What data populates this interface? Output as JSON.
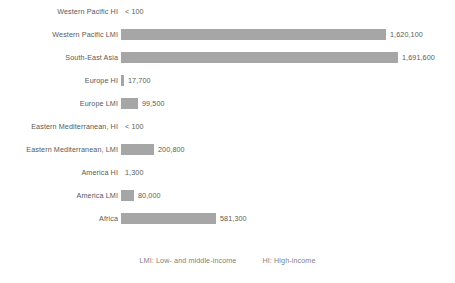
{
  "chart_data": {
    "type": "bar",
    "orientation": "horizontal",
    "title": "",
    "xlabel": "",
    "ylabel": "",
    "grid": false,
    "axis_visible": false,
    "xlim": [
      0,
      1691600
    ],
    "bar_color": "#a6a6a6",
    "label_color": "#595959",
    "categories": [
      "Western Pacific HI",
      "Western Pacific LMI",
      "South-East Asia",
      "Europe HI",
      "Europe LMI",
      "Eastern Mediterranean, HI",
      "Eastern Mediterranean, LMI",
      "America HI",
      "America LMI",
      "Africa"
    ],
    "values": [
      0,
      1620100,
      1691600,
      17700,
      99500,
      0,
      200800,
      1300,
      80000,
      581300
    ],
    "value_labels": [
      "< 100",
      "1,620,100",
      "1,691,600",
      "17,700",
      "99,500",
      "< 100",
      "200,800",
      "1,300",
      "80,000",
      "581,300"
    ],
    "bars": [
      {
        "category": "Western Pacific HI",
        "value": 0,
        "label": "< 100",
        "bar_px": 0
      },
      {
        "category": "Western Pacific LMI",
        "value": 1620100,
        "label": "1,620,100",
        "bar_px": 265
      },
      {
        "category": "South-East Asia",
        "value": 1691600,
        "label": "1,691,600",
        "bar_px": 277
      },
      {
        "category": "Europe HI",
        "value": 17700,
        "label": "17,700",
        "bar_px": 3
      },
      {
        "category": "Europe LMI",
        "value": 99500,
        "label": "99,500",
        "bar_px": 17
      },
      {
        "category": "Eastern Mediterranean, HI",
        "value": 0,
        "label": "< 100",
        "bar_px": 0
      },
      {
        "category": "Eastern Mediterranean, LMI",
        "value": 200800,
        "label": "200,800",
        "bar_px": 33
      },
      {
        "category": "America HI",
        "value": 1300,
        "label": "1,300",
        "bar_px": 0
      },
      {
        "category": "America LMI",
        "value": 80000,
        "label": "80,000",
        "bar_px": 13
      },
      {
        "category": "Africa",
        "value": 581300,
        "label": "581,300",
        "bar_px": 95
      }
    ],
    "legend_position": "bottom",
    "legend": [
      "LMI: Low- and middle-income",
      "HI: High-income"
    ]
  }
}
